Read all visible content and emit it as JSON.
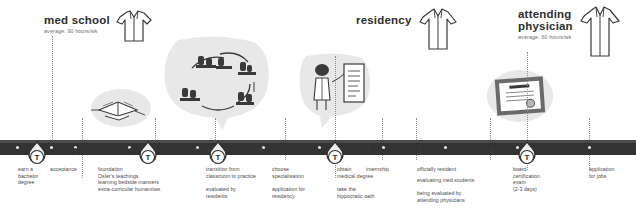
{
  "phases": [
    {
      "id": "med-school",
      "title": "med school",
      "subtitle": "average: 90 hours/wk",
      "coat": "short-white-coat-icon"
    },
    {
      "id": "residency",
      "title": "residency",
      "subtitle": "",
      "coat": "medium-white-coat-icon"
    },
    {
      "id": "attending-physician",
      "title": "attending\nphysician",
      "subtitle": "average: 60 hours/wk",
      "coat": "long-white-coat-icon"
    }
  ],
  "illustrations": [
    {
      "id": "open-book-illustration",
      "label": "open book with notes"
    },
    {
      "id": "classroom-cycle-illustration",
      "label": "cycle of classroom and practice scenes"
    },
    {
      "id": "graduate-diploma-illustration",
      "label": "graduate with medical degree scroll"
    },
    {
      "id": "framed-certificate-illustration",
      "label": "framed board certification certificate"
    }
  ],
  "timeline": {
    "badge_letter": "T",
    "badges": [
      {
        "id": "badge-bachelor"
      },
      {
        "id": "badge-foundation"
      },
      {
        "id": "badge-transition"
      },
      {
        "id": "badge-medical-degree"
      },
      {
        "id": "badge-board-exam"
      }
    ]
  },
  "steps": [
    {
      "id": "earn-bachelor-degree",
      "number": "",
      "primary": "earn a\nbachelor\ndegree",
      "secondary": ""
    },
    {
      "id": "acceptance",
      "number": "1",
      "primary": "acceptance",
      "secondary": ""
    },
    {
      "id": "foundation",
      "number": "2",
      "primary": "foundation\nOsler's teachings\nlearning bedside manners\nextra-curricular humanities",
      "secondary": ""
    },
    {
      "id": "transition-to-practice",
      "number": "3",
      "primary": "transition from\nclassroom to practice",
      "secondary": "evaluated by\nresidents"
    },
    {
      "id": "choose-specialisation",
      "number": "4",
      "primary": "choose\nspecialisation",
      "secondary": "application for\nresidency"
    },
    {
      "id": "obtain-medical-degree",
      "number": "",
      "primary": "obtain\nmedical degree",
      "secondary": "take the\nhippocratic oath"
    },
    {
      "id": "internship",
      "number": "1",
      "primary": "internship",
      "secondary": ""
    },
    {
      "id": "officially-resident",
      "number": "2",
      "primary": "officially resident",
      "secondary": "evaluating med students\n\nbeing evaluated by\nattending physicians"
    },
    {
      "id": "board-certification-exam",
      "number": "3",
      "primary": "board\ncertification\nexam\n(2-3 days)",
      "secondary": ""
    },
    {
      "id": "application-for-jobs",
      "number": "",
      "primary": "application\nfor jobs",
      "secondary": ""
    }
  ],
  "colors": {
    "timeline_bar": "#333333",
    "blob_fill": "#e8e8e8",
    "text": "#4a4a4a",
    "tick": "#f2f2f2"
  }
}
